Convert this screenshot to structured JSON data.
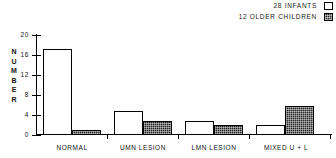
{
  "legend": {
    "entries": [
      {
        "label": "28 INFANTS",
        "swatch": "light-square-swatch",
        "color": "#ffffff"
      },
      {
        "label": "12 OLDER CHILDREN",
        "swatch": "dark-stippled-square-swatch",
        "color": "#262626"
      }
    ]
  },
  "axis": {
    "ylabel_letters": [
      "N",
      "U",
      "M",
      "B",
      "E",
      "R"
    ],
    "yticks": [
      "0",
      "4",
      "8",
      "12",
      "16",
      "20"
    ]
  },
  "chart_data": {
    "type": "bar",
    "title": "",
    "xlabel": "",
    "ylabel": "NUMBER",
    "ylim": [
      0,
      20
    ],
    "ytick_values": [
      0,
      4,
      8,
      12,
      16,
      20
    ],
    "grid": false,
    "legend_position": "top-right",
    "categories": [
      "NORMAL",
      "UMN LESION",
      "LMN LESION",
      "MIXED U + L"
    ],
    "series": [
      {
        "name": "28 INFANTS",
        "values": [
          18,
          5,
          3,
          2
        ],
        "color": "#ffffff"
      },
      {
        "name": "12 OLDER CHILDREN",
        "values": [
          1,
          3,
          2,
          6
        ],
        "color": "#262626"
      }
    ]
  }
}
